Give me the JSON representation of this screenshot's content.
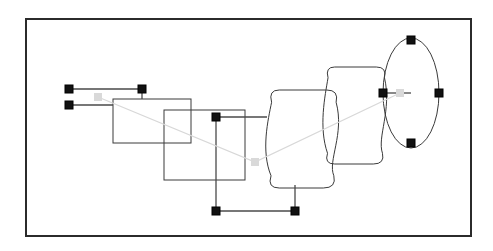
{
  "document": {
    "title": "Shape Selection Canvas",
    "background_color": "#ffffff",
    "width": 493,
    "height": 251
  },
  "frame": {
    "name": "canvas-frame",
    "x": 26,
    "y": 19,
    "width": 445,
    "height": 217,
    "stroke_color": "#2b2b2b",
    "stroke_width": 2,
    "fill": "#ffffff"
  },
  "style": {
    "shape_stroke_color": "#3a3a3a",
    "shape_stroke_width": 1,
    "shape_fill": "none",
    "connector_stroke_color": "#4a4a4a",
    "connector_stroke_width": 1.3,
    "guide_stroke_color": "#d8d8d8",
    "guide_stroke_width": 1.2,
    "handle_fill": "#111111",
    "handle_stroke": "#000000",
    "handle_size": 8,
    "center_marker_fill": "#d9d9d9",
    "center_marker_size": 8
  },
  "shapes": [
    {
      "id": "rect-back",
      "label": "Rectangle A",
      "type": "rect",
      "x": 113,
      "y": 99,
      "width": 78,
      "height": 44
    },
    {
      "id": "rect-front",
      "label": "Rectangle B",
      "type": "rect",
      "x": 164,
      "y": 110,
      "width": 81,
      "height": 70
    },
    {
      "id": "barrel-left",
      "label": "Barrel A",
      "type": "barrel",
      "x": 267,
      "y": 90,
      "width": 72,
      "height": 98
    },
    {
      "id": "barrel-right",
      "label": "Barrel B",
      "type": "barrel",
      "x": 324,
      "y": 67,
      "width": 63,
      "height": 97
    },
    {
      "id": "ellipse-right",
      "label": "Ellipse",
      "type": "ellipse",
      "cx": 411,
      "cy": 93,
      "rx": 28,
      "ry": 55
    }
  ],
  "connectors": [
    {
      "id": "connector-top-left",
      "label": "Top left leader",
      "points": "69,89 142,89 142,99"
    },
    {
      "id": "connector-mid-left",
      "label": "Mid left leader",
      "points": "69,105 113,105"
    },
    {
      "id": "connector-right-stub",
      "label": "Right stub to barrel",
      "points": "216,117 267,117"
    },
    {
      "id": "connector-bottom-rect",
      "label": "Rectangle bottom drop",
      "points": "216,117 216,211"
    },
    {
      "id": "connector-bottom-bar",
      "label": "Bottom connector bar",
      "points": "216,211 295,211"
    },
    {
      "id": "connector-barrel-drop",
      "label": "Barrel bottom drop",
      "points": "295,211 295,185"
    },
    {
      "id": "connector-ellipse-link",
      "label": "Barrel to ellipse link",
      "points": "383,93 411,93"
    }
  ],
  "guide_line": {
    "id": "alignment-guide",
    "label": "Alignment guide",
    "points": "98,97 255,162 400,93"
  },
  "handles": [
    {
      "id": "handle-1",
      "label": "Top left handle",
      "x": 69,
      "y": 89
    },
    {
      "id": "handle-2",
      "label": "Upper mid handle",
      "x": 142,
      "y": 89
    },
    {
      "id": "handle-3",
      "label": "Lower left handle",
      "x": 69,
      "y": 105
    },
    {
      "id": "handle-4",
      "label": "Rectangle corner handle",
      "x": 216,
      "y": 117
    },
    {
      "id": "handle-5",
      "label": "Bottom left handle",
      "x": 216,
      "y": 211
    },
    {
      "id": "handle-6",
      "label": "Bottom right handle",
      "x": 295,
      "y": 211
    },
    {
      "id": "handle-7",
      "label": "Ellipse left handle",
      "x": 383,
      "y": 93
    },
    {
      "id": "handle-8",
      "label": "Ellipse top handle",
      "x": 411,
      "y": 40
    },
    {
      "id": "handle-9",
      "label": "Ellipse right handle",
      "x": 439,
      "y": 93
    },
    {
      "id": "handle-10",
      "label": "Ellipse bottom handle",
      "x": 411,
      "y": 143
    }
  ],
  "center_markers": [
    {
      "id": "marker-left",
      "label": "Left anchor marker",
      "x": 98,
      "y": 97
    },
    {
      "id": "marker-middle",
      "label": "Middle anchor marker",
      "x": 255,
      "y": 162
    },
    {
      "id": "marker-right",
      "label": "Ellipse center marker",
      "x": 400,
      "y": 93
    }
  ]
}
